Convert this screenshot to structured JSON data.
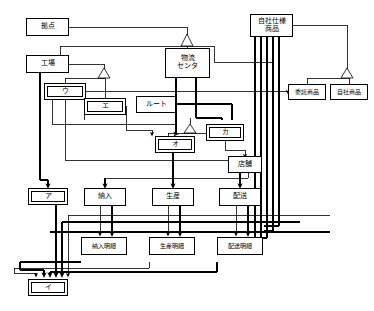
{
  "diagram": {
    "type": "entity-relationship-class-diagram",
    "language": "ja",
    "canvas": {
      "width": 374,
      "height": 311
    },
    "line_color": "#000000",
    "box_fill": "#ffffff",
    "nodes": [
      {
        "id": "kyoten",
        "label": "拠点",
        "x": 26,
        "y": 18,
        "w": 43,
        "h": 18,
        "double": false
      },
      {
        "id": "koujou",
        "label": "工場",
        "x": 26,
        "y": 55,
        "w": 43,
        "h": 18,
        "double": false
      },
      {
        "id": "butsuryu",
        "label": "物流\nセンタ",
        "x": 165,
        "y": 48,
        "w": 45,
        "h": 30,
        "double": false
      },
      {
        "id": "jisha_shiyou",
        "label": "自社仕様\n商品",
        "x": 250,
        "y": 14,
        "w": 43,
        "h": 23,
        "double": false
      },
      {
        "id": "itaku_shouhin",
        "label": "委託商品",
        "x": 288,
        "y": 84,
        "w": 38,
        "h": 16,
        "double": false
      },
      {
        "id": "jisha_shouhin",
        "label": "自社商品",
        "x": 330,
        "y": 84,
        "w": 38,
        "h": 16,
        "double": false
      },
      {
        "id": "u",
        "label": "ウ",
        "x": 44,
        "y": 83,
        "w": 42,
        "h": 17,
        "double": true
      },
      {
        "id": "e",
        "label": "エ",
        "x": 84,
        "y": 98,
        "w": 42,
        "h": 17,
        "double": true
      },
      {
        "id": "route",
        "label": "ルート",
        "x": 136,
        "y": 96,
        "w": 40,
        "h": 17,
        "double": false
      },
      {
        "id": "o",
        "label": "オ",
        "x": 155,
        "y": 136,
        "w": 40,
        "h": 17,
        "double": true
      },
      {
        "id": "ka",
        "label": "カ",
        "x": 206,
        "y": 124,
        "w": 38,
        "h": 17,
        "double": true
      },
      {
        "id": "tenpo",
        "label": "店舗",
        "x": 228,
        "y": 156,
        "w": 34,
        "h": 17,
        "double": false
      },
      {
        "id": "a",
        "label": "ア",
        "x": 28,
        "y": 188,
        "w": 40,
        "h": 17,
        "double": true
      },
      {
        "id": "nounyuu",
        "label": "納入",
        "x": 84,
        "y": 188,
        "w": 42,
        "h": 18,
        "double": false
      },
      {
        "id": "seisan",
        "label": "生産",
        "x": 152,
        "y": 188,
        "w": 42,
        "h": 18,
        "double": false
      },
      {
        "id": "haisou",
        "label": "配送",
        "x": 219,
        "y": 188,
        "w": 42,
        "h": 18,
        "double": false
      },
      {
        "id": "nounyuu_meisai",
        "label": "納入明細",
        "x": 81,
        "y": 237,
        "w": 46,
        "h": 18,
        "double": false
      },
      {
        "id": "seisan_meisai",
        "label": "生産明細",
        "x": 149,
        "y": 237,
        "w": 46,
        "h": 18,
        "double": false
      },
      {
        "id": "haisou_meisai",
        "label": "配送明細",
        "x": 217,
        "y": 237,
        "w": 46,
        "h": 18,
        "double": false
      },
      {
        "id": "i",
        "label": "イ",
        "x": 28,
        "y": 279,
        "w": 40,
        "h": 17,
        "double": true
      }
    ],
    "generalizations": [
      {
        "parent": "kyoten",
        "children": [
          "koujou",
          "butsuryu"
        ]
      },
      {
        "parent": "koujou",
        "children": [
          "u",
          "e"
        ]
      },
      {
        "parent": "jisha_shiyou",
        "children": [
          "itaku_shouhin",
          "jisha_shouhin"
        ]
      },
      {
        "parent": "unnamed",
        "children": [
          "o",
          "ka"
        ]
      }
    ]
  }
}
